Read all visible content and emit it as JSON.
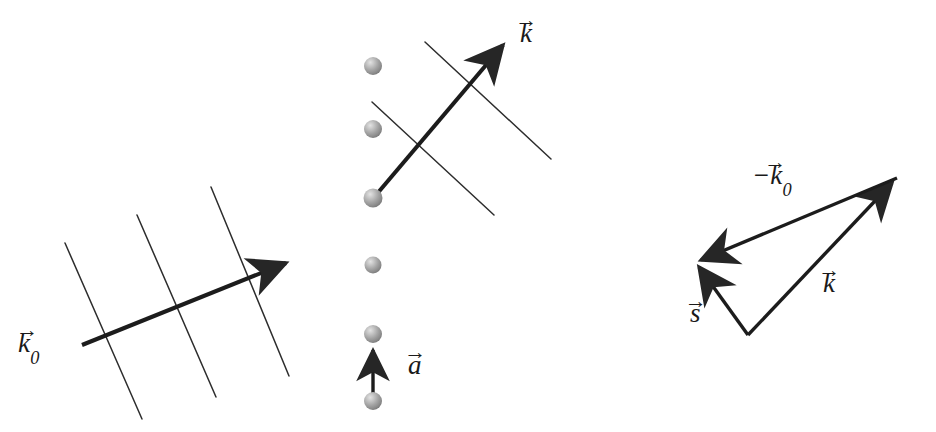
{
  "figure": {
    "background_color": "#ffffff",
    "line_color": "#262626",
    "sphere_color": "#9a9a9a",
    "width": 936,
    "height": 432
  },
  "panels": {
    "left": {
      "name": "incident-beam-on-lattice-planes",
      "label_k0": "k",
      "label_k0_sub": "0",
      "planes_count": 3,
      "planes": [
        {
          "x1": 65,
          "y1": 243,
          "x2": 142,
          "y2": 419
        },
        {
          "x1": 137,
          "y1": 215,
          "x2": 216,
          "y2": 397
        },
        {
          "x1": 211,
          "y1": 187,
          "x2": 289,
          "y2": 376
        }
      ],
      "arrow": {
        "x1": 82,
        "y1": 345,
        "x2": 291,
        "y2": 261
      }
    },
    "middle": {
      "name": "scattered-beam-from-atom-row",
      "label_k": "k",
      "label_a": "a",
      "atoms_count": 5,
      "atom_radius": 9,
      "atoms": [
        {
          "cx": 373,
          "cy": 66
        },
        {
          "cx": 373,
          "cy": 129
        },
        {
          "cx": 373,
          "cy": 198
        },
        {
          "cx": 373,
          "cy": 265
        },
        {
          "cx": 373,
          "cy": 334
        }
      ],
      "atom_bottom": {
        "cx": 373,
        "cy": 401
      },
      "k_arrow": {
        "x1": 376,
        "y1": 195,
        "x2": 508,
        "y2": 40
      },
      "a_arrow": {
        "x1": 373,
        "y1": 398,
        "x2": 373,
        "y2": 344
      },
      "wavefronts": [
        {
          "x1": 425,
          "y1": 42,
          "x2": 551,
          "y2": 159
        },
        {
          "x1": 372,
          "y1": 102,
          "x2": 494,
          "y2": 215
        }
      ]
    },
    "right": {
      "name": "scattering-vector-triangle",
      "label_minus_k0": "−k",
      "label_minus_k0_sub": "0",
      "label_k": "k",
      "label_s": "s",
      "vertices": {
        "apex_bottom": {
          "x": 748,
          "y": 335
        },
        "left": {
          "x": 695,
          "y": 262
        },
        "top_right": {
          "x": 897,
          "y": 178
        }
      },
      "arrows": [
        {
          "name": "k-vector",
          "x1": 748,
          "y1": 335,
          "x2": 897,
          "y2": 178
        },
        {
          "name": "minus-k0-vector",
          "x1": 897,
          "y1": 178,
          "x2": 695,
          "y2": 262
        },
        {
          "name": "s-vector",
          "x1": 748,
          "y1": 335,
          "x2": 695,
          "y2": 262
        }
      ]
    }
  }
}
